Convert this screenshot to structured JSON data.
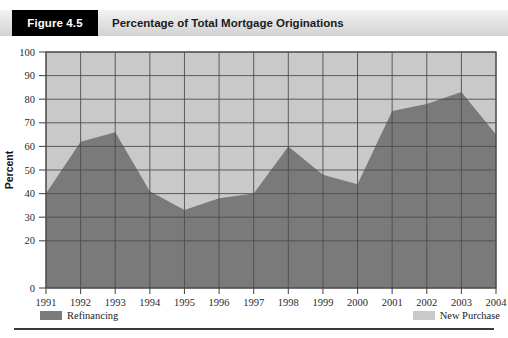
{
  "header": {
    "badge": "Figure 4.5",
    "title": "Percentage of Total Mortgage Originations"
  },
  "legend": {
    "items": [
      {
        "label": "Refinancing",
        "color": "#7a7a7a",
        "position": "left"
      },
      {
        "label": "New Purchase",
        "color": "#c9c9c9",
        "position": "right"
      }
    ]
  },
  "chart_data": {
    "type": "area",
    "stacked": true,
    "title": "Percentage of Total Mortgage Originations",
    "xlabel": "",
    "ylabel": "Percent",
    "ylim": [
      0,
      100
    ],
    "yticks": [
      0,
      20,
      30,
      40,
      50,
      60,
      70,
      80,
      90,
      100
    ],
    "ytick_labels": [
      "0",
      "20",
      "30",
      "40",
      "50",
      "60",
      "70",
      "80",
      "90",
      "100"
    ],
    "grid": true,
    "legend_position": "bottom",
    "categories": [
      "1991",
      "1992",
      "1993",
      "1994",
      "1995",
      "1996",
      "1997",
      "1998",
      "1999",
      "2000",
      "2001",
      "2002",
      "2003",
      "2004"
    ],
    "x": [
      1991,
      1992,
      1993,
      1994,
      1995,
      1996,
      1997,
      1998,
      1999,
      2000,
      2001,
      2002,
      2003,
      2004
    ],
    "series": [
      {
        "name": "Refinancing",
        "color": "#7a7a7a",
        "values": [
          40,
          62,
          66,
          41,
          33,
          38,
          40,
          60,
          48,
          44,
          75,
          78,
          83,
          65
        ]
      },
      {
        "name": "New Purchase",
        "color": "#c9c9c9",
        "values": [
          60,
          38,
          34,
          59,
          67,
          62,
          60,
          40,
          52,
          56,
          25,
          22,
          17,
          35
        ]
      }
    ]
  },
  "axis": {
    "y_title": "Percent"
  }
}
